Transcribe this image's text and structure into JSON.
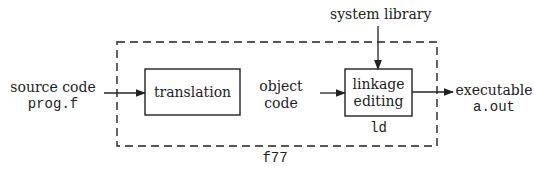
{
  "input": {
    "label": "source code",
    "file": "prog.f"
  },
  "translation": {
    "label": "translation"
  },
  "intermediate": {
    "line1": "object",
    "line2": "code"
  },
  "linker": {
    "line1": "linkage",
    "line2": "editing",
    "tool": "ld"
  },
  "library": {
    "label": "system library"
  },
  "output": {
    "label": "executable",
    "file": "a.out"
  },
  "compiler": {
    "label": "f77"
  }
}
